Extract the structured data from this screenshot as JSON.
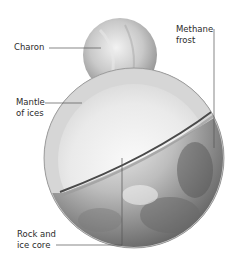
{
  "diagram": {
    "labels": {
      "charon": "Charon",
      "mantle": "Mantle\nof ices",
      "methane": "Methane\nfrost",
      "core": "Rock and\nice core"
    },
    "colors": {
      "background": "#ffffff",
      "text": "#2b2b2b",
      "leader_line": "#555555",
      "ice_mantle": "#d9d9d9",
      "core": "#eeeeee",
      "surface_dark": "#6e6e6e",
      "surface_light": "#e6e6e6",
      "cut_edge": "#4a4a4a"
    }
  }
}
